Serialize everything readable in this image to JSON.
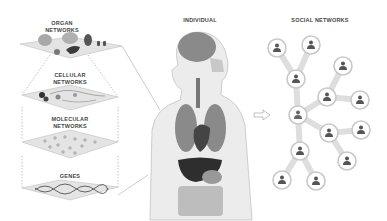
{
  "layers": [
    {
      "id": "organ",
      "label": "ORGAN\nNETWORKS"
    },
    {
      "id": "cellular",
      "label": "CELLULAR\nNETWORKS"
    },
    {
      "id": "molecular",
      "label": "MOLECULAR\nNETWORKS"
    },
    {
      "id": "genes",
      "label": "GENES"
    }
  ],
  "individual": {
    "label": "INDIVIDUAL"
  },
  "social": {
    "label": "SOCIAL NETWORKS",
    "nodes": [
      {
        "x": 277,
        "y": 48
      },
      {
        "x": 311,
        "y": 45
      },
      {
        "x": 296,
        "y": 79
      },
      {
        "x": 343,
        "y": 66
      },
      {
        "x": 327,
        "y": 97
      },
      {
        "x": 360,
        "y": 100
      },
      {
        "x": 298,
        "y": 115,
        "highlight": true
      },
      {
        "x": 329,
        "y": 133
      },
      {
        "x": 361,
        "y": 130
      },
      {
        "x": 300,
        "y": 151
      },
      {
        "x": 347,
        "y": 161
      },
      {
        "x": 282,
        "y": 180
      },
      {
        "x": 316,
        "y": 181
      }
    ]
  },
  "colors": {
    "plane": "#e4e4e4",
    "plane_edge": "#bdbdbd",
    "body": "#ececec",
    "body_edge": "#bcbcbc",
    "organ_dark": "#3a3a3a",
    "organ_mid": "#8a8a8a",
    "organ_light": "#a8a8a8",
    "node_ring": "#c8c8c8",
    "person": "#555555"
  }
}
